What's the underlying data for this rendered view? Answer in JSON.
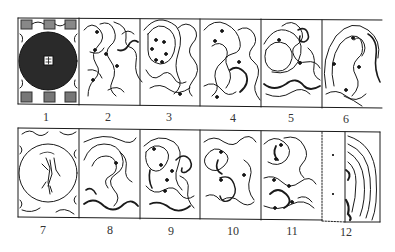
{
  "figure": {
    "panels": [
      {
        "label": "1",
        "content": "dark disc with central square emblem and small figure cells around border"
      },
      {
        "label": "2",
        "content": "cloud scroll pattern"
      },
      {
        "label": "3",
        "content": "cloud scroll pattern"
      },
      {
        "label": "4",
        "content": "cloud scroll pattern"
      },
      {
        "label": "5",
        "content": "cloud scroll pattern"
      },
      {
        "label": "6",
        "content": "cloud scroll pattern"
      },
      {
        "label": "7",
        "content": "circle containing bird-like figure with cloud scrolls in corners"
      },
      {
        "label": "8",
        "content": "cloud scroll pattern"
      },
      {
        "label": "9",
        "content": "cloud scroll pattern"
      },
      {
        "label": "10",
        "content": "cloud scroll pattern"
      },
      {
        "label": "11",
        "content": "cloud scroll pattern"
      },
      {
        "label": "12",
        "content": "blank strip with two small marks beside cloud scroll pattern"
      }
    ]
  },
  "colors": {
    "ink": "#1a1a1a",
    "disc": "#2a2a2a",
    "paper": "#ffffff"
  }
}
